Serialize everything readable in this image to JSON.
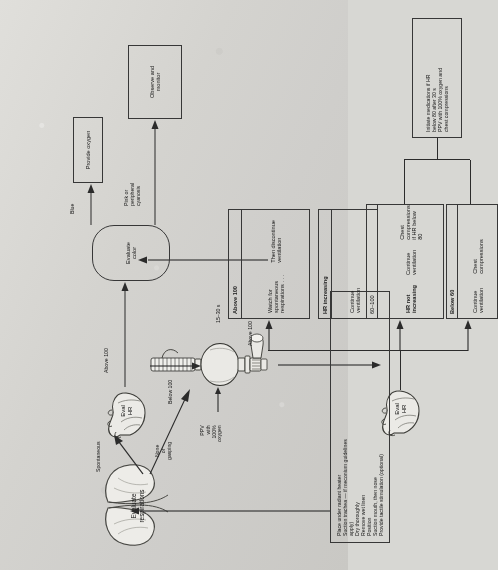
{
  "figure": {
    "type": "flowchart"
  },
  "initial_steps": {
    "name": "initial-steps-box",
    "lines": [
      "Place under radiant heater",
      "Suction trachea — if meconium guidelines",
      "apply)",
      "Dry thoroughly",
      "Remove wet linen",
      "Position",
      "Suction mouth, then nose",
      "Provide tactile stimulation (optional)"
    ]
  },
  "nodes": {
    "evaluate_respirations": "Evaluate\nrespirations",
    "eval_hr_top": "Eval\nHR",
    "eval_hr_bottom": "Eval\nHR",
    "evaluate_color": "Evaluate\ncolor",
    "provide_oxygen": "Provide oxygen",
    "observe_monitor": "Observe and\nmonitor"
  },
  "edge_labels": {
    "spontaneous": "Spontaneous",
    "none_or_gasping": "None\nor\ngasping",
    "below_100_top": "Below 100",
    "above_100_top": "Above 100",
    "blue": "Blue",
    "pink_or_cyanosis": "Pink or\nperipheral\ncyanosis",
    "ppv_100_oxygen": "PPV\nwith\n100%\noxygen",
    "duration": "15–30 s",
    "above_100_lower": "Above 100",
    "hr_increasing": "HR increasing",
    "range_60_100": "60–100",
    "below_60": "Below 60"
  },
  "outcome_boxes": [
    {
      "name": "above-100-outcome-box",
      "header": "Above 100",
      "body": [
        "Watch for\nspontaneous\nrespirations . . .",
        "Then discontinue\nventilation"
      ]
    },
    {
      "name": "hr-increasing-outcome-box",
      "header": "HR increasing",
      "body": [
        "Continue\nventilation"
      ]
    },
    {
      "name": "hr-60-100-outcome-box",
      "header": "60–100",
      "subheader": "HR not increasing",
      "body": [
        "Continue\nventilation",
        "Chest\ncompressions\nif HR below 80"
      ]
    },
    {
      "name": "below-60-outcome-box",
      "header": "Below 60",
      "body": [
        "Continue\nventilation",
        "Chest\ncompressions"
      ]
    }
  ],
  "medications_box": {
    "name": "medications-box",
    "lines": [
      "Initiate medications if HR",
      "below 80 after 30 s",
      "PPV with 100% oxygen and",
      "chest compressions"
    ]
  },
  "colors": {
    "ink": "#1c1c1c",
    "line": "#2e2e2e",
    "paper": "#d4d3cf"
  }
}
